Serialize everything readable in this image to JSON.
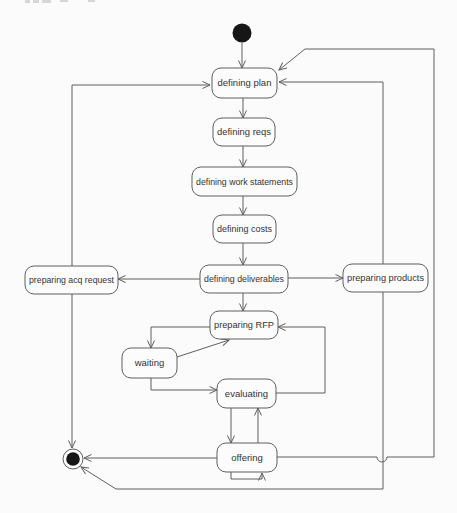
{
  "diagram": {
    "kind": "uml-state-diagram",
    "colors": {
      "background": "#fbfbfb",
      "stroke": "#5f5f5f",
      "node_fill": "#fcfcfc",
      "text": "#333333",
      "terminal_fill": "#161616"
    },
    "nodes": [
      {
        "id": "initial",
        "type": "initial",
        "label": "",
        "cx": 242,
        "cy": 33,
        "r": 9.5
      },
      {
        "id": "defining-plan",
        "type": "state",
        "label": "defining plan",
        "x": 212,
        "y": 68,
        "w": 65,
        "h": 30
      },
      {
        "id": "defining-reqs",
        "type": "state",
        "label": "defining reqs",
        "x": 213,
        "y": 118,
        "w": 62,
        "h": 28
      },
      {
        "id": "defining-work-statements",
        "type": "state",
        "label": "defining work statements",
        "x": 192,
        "y": 167,
        "w": 105,
        "h": 29
      },
      {
        "id": "defining-costs",
        "type": "state",
        "label": "defining costs",
        "x": 213,
        "y": 215,
        "w": 63,
        "h": 28
      },
      {
        "id": "preparing-acq-request",
        "type": "state",
        "label": "preparing acq request",
        "x": 25,
        "y": 266,
        "w": 93,
        "h": 28
      },
      {
        "id": "defining-deliverables",
        "type": "state",
        "label": "defining deliverables",
        "x": 200,
        "y": 265,
        "w": 88,
        "h": 28
      },
      {
        "id": "preparing-products",
        "type": "state",
        "label": "preparing products",
        "x": 343,
        "y": 264,
        "w": 85,
        "h": 28
      },
      {
        "id": "preparing-rfp",
        "type": "state",
        "label": "preparing RFP",
        "x": 210,
        "y": 311,
        "w": 68,
        "h": 28
      },
      {
        "id": "waiting",
        "type": "state",
        "label": "waiting",
        "x": 122,
        "y": 348,
        "w": 55,
        "h": 30
      },
      {
        "id": "evaluating",
        "type": "state",
        "label": "evaluating",
        "x": 217,
        "y": 379,
        "w": 59,
        "h": 29
      },
      {
        "id": "offering",
        "type": "state",
        "label": "offering",
        "x": 217,
        "y": 443,
        "w": 60,
        "h": 29
      },
      {
        "id": "final",
        "type": "final",
        "label": "",
        "cx": 73,
        "cy": 459,
        "r": 10,
        "inner_r": 6.8
      }
    ],
    "edges": [
      {
        "id": "initial-to-defining-plan",
        "from": "initial",
        "to": "defining-plan",
        "d": "M 242 43 L 242 68"
      },
      {
        "id": "defining-plan-to-defining-reqs",
        "from": "defining-plan",
        "to": "defining-reqs",
        "d": "M 243 98 L 243 118"
      },
      {
        "id": "defining-reqs-to-defining-work-statements",
        "from": "defining-reqs",
        "to": "defining-work-statements",
        "d": "M 243 146 L 243 167"
      },
      {
        "id": "defining-work-statements-to-defining-costs",
        "from": "defining-work-statements",
        "to": "defining-costs",
        "d": "M 243 196 L 243 215"
      },
      {
        "id": "defining-costs-to-defining-deliverables",
        "from": "defining-costs",
        "to": "defining-deliverables",
        "d": "M 243 243 L 243 265"
      },
      {
        "id": "defining-deliverables-to-preparing-acq-request",
        "from": "defining-deliverables",
        "to": "preparing-acq-request",
        "d": "M 200 279 L 118 279"
      },
      {
        "id": "defining-deliverables-to-preparing-products",
        "from": "defining-deliverables",
        "to": "preparing-products",
        "d": "M 288 278 L 343 278"
      },
      {
        "id": "defining-deliverables-to-preparing-rfp",
        "from": "defining-deliverables",
        "to": "preparing-rfp",
        "d": "M 243 293 L 243 311"
      },
      {
        "id": "preparing-rfp-to-waiting",
        "from": "preparing-rfp",
        "to": "waiting",
        "d": "M 210 327 L 151 327 L 151 348"
      },
      {
        "id": "waiting-to-preparing-rfp",
        "from": "waiting",
        "to": "preparing-rfp",
        "d": "M 177 357 L 229 340"
      },
      {
        "id": "waiting-to-evaluating",
        "from": "waiting",
        "to": "evaluating",
        "d": "M 151 378 L 151 390 L 217 390"
      },
      {
        "id": "evaluating-to-preparing-rfp",
        "from": "evaluating",
        "to": "preparing-rfp",
        "d": "M 276 393 L 325 393 L 325 327 L 278 327"
      },
      {
        "id": "evaluating-to-offering",
        "from": "evaluating",
        "to": "offering",
        "d": "M 231 408 L 231 443"
      },
      {
        "id": "offering-to-evaluating",
        "from": "offering",
        "to": "evaluating",
        "d": "M 258 443 L 258 408"
      },
      {
        "id": "offering-self-loop",
        "from": "offering",
        "to": "offering",
        "d": "M 231 472 L 231 479 L 262 479 L 262 473"
      },
      {
        "id": "offering-to-final",
        "from": "offering",
        "to": "final",
        "d": "M 217 458 L 84 458"
      },
      {
        "id": "offering-to-defining-plan",
        "from": "offering",
        "to": "defining-plan",
        "d": "M 277 457 L 377 457 A 5 5 0 0 0 387 457 L 434 457 L 434 49 L 305 49 L 279 70"
      },
      {
        "id": "preparing-acq-request-to-defining-plan",
        "from": "preparing-acq-request",
        "to": "defining-plan",
        "d": "M 72 266 L 72 85 L 210 85"
      },
      {
        "id": "preparing-acq-request-to-final",
        "from": "preparing-acq-request",
        "to": "final",
        "d": "M 72 293 L 72 448"
      },
      {
        "id": "preparing-products-to-defining-plan",
        "from": "preparing-products",
        "to": "defining-plan",
        "d": "M 383 264 L 383 82 L 279 82"
      },
      {
        "id": "preparing-products-to-final",
        "from": "preparing-products",
        "to": "final",
        "d": "M 383 292 L 383 489 L 116 489 L 81 467"
      }
    ]
  }
}
